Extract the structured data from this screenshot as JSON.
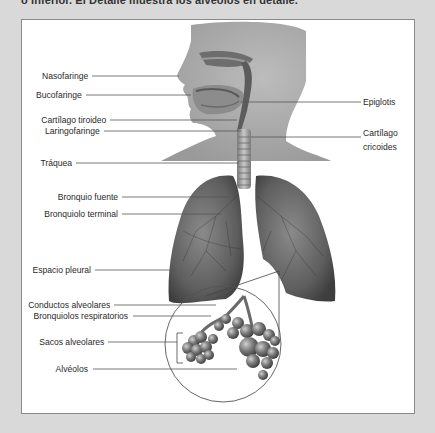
{
  "caption": "o inferior. El Detalle muestra los alvéolos en detalle.",
  "diagram": {
    "labels_left": [
      {
        "id": "nasofaringe",
        "text": "Nasofaringe",
        "y": 75
      },
      {
        "id": "bucofaringe",
        "text": "Bucofaringe",
        "y": 94
      },
      {
        "id": "cartilago-tiroideo",
        "text": "Cartílago tiroideo",
        "y": 119
      },
      {
        "id": "laringofaringe",
        "text": "Laringofaringe",
        "y": 130
      },
      {
        "id": "traquea",
        "text": "Tráquea",
        "y": 162
      },
      {
        "id": "bronquio-fuente",
        "text": "Bronquio fuente",
        "y": 196
      },
      {
        "id": "bronquiolo-terminal",
        "text": "Bronquiolo terminal",
        "y": 213
      },
      {
        "id": "espacio-pleural",
        "text": "Espacio pleural",
        "y": 269
      },
      {
        "id": "conductos-alveolares",
        "text": "Conductos alveolares",
        "y": 304
      },
      {
        "id": "bronquiolos-respiratorios",
        "text": "Bronquiolos respiratorios",
        "y": 315
      },
      {
        "id": "sacos-alveolares",
        "text": "Sacos alveolares",
        "y": 341
      },
      {
        "id": "alveolos",
        "text": "Alvéolos",
        "y": 368
      }
    ],
    "labels_right": [
      {
        "id": "epiglotis",
        "text": "Epiglotis",
        "y": 101
      },
      {
        "id": "cartilago-cricoides-1",
        "text": "Cartílago",
        "y": 132
      },
      {
        "id": "cartilago-cricoides-2",
        "text": "cricoides",
        "y": 146
      }
    ]
  }
}
